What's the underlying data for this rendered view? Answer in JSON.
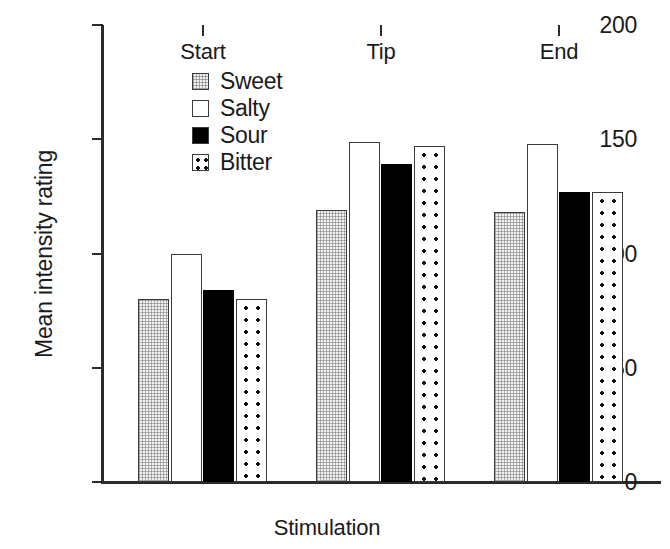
{
  "chart_data": {
    "type": "bar",
    "title": "",
    "subtitle": "",
    "xlabel": "Stimulation",
    "ylabel": "Mean intensity rating",
    "categories": [
      "Start",
      "Tip",
      "End"
    ],
    "series": [
      {
        "name": "Sweet",
        "values": [
          80,
          119,
          118
        ]
      },
      {
        "name": "Salty",
        "values": [
          100,
          149,
          148
        ]
      },
      {
        "name": "Sour",
        "values": [
          84,
          139,
          127
        ]
      },
      {
        "name": "Bitter",
        "values": [
          80,
          147,
          127
        ]
      }
    ],
    "ylim": [
      0,
      200
    ],
    "yticks": [
      0,
      50,
      100,
      150,
      200
    ],
    "ytick_labels": [
      "0",
      "50",
      "100",
      "150",
      "200"
    ],
    "grid": false,
    "legend_position": "upper-left-inside",
    "legend_entries": [
      "Sweet",
      "Salty",
      "Sour",
      "Bitter"
    ],
    "fills": {
      "Sweet": "light-checker-stipple",
      "Salty": "white-open",
      "Sour": "solid-black",
      "Bitter": "coarse-black-dots"
    },
    "colors": {
      "axis": "#2b2b2b",
      "bar_outline": "#3a3a3a",
      "sweet": "#f2f2f2",
      "salty": "#ffffff",
      "sour": "#000000",
      "bitter": "#ffffff",
      "text": "#1a1a1a",
      "background": "#ffffff"
    }
  }
}
